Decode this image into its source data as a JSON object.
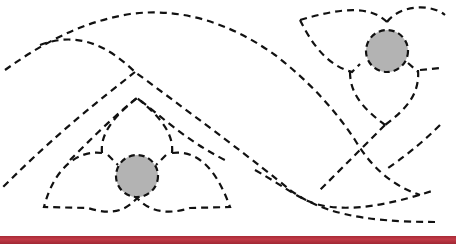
{
  "diagram": {
    "type": "dashed-line quilting pattern",
    "motifs": [
      {
        "name": "upper-right-flower",
        "center_circle": {
          "cx": 387,
          "cy": 51,
          "r": 21
        }
      },
      {
        "name": "lower-left-flower",
        "center_circle": {
          "cx": 137,
          "cy": 176,
          "r": 21
        }
      }
    ],
    "colors": {
      "line": "#111111",
      "circle_fill": "#b3b3b3",
      "background": "#ffffff",
      "bottom_band": "#b5303c"
    }
  }
}
